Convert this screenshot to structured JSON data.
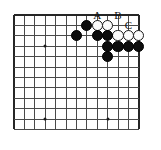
{
  "diagram": {
    "kind": "go-board-diagram",
    "board": {
      "columns": 13,
      "rows": 12,
      "cell_size": 10.4,
      "origin_x": 14,
      "origin_y": 15,
      "line_color": "#4a4a4a",
      "edge_color": "#262626",
      "background_color": "#ffffff"
    },
    "star_points": [
      {
        "col": 3,
        "row": 3
      },
      {
        "col": 3,
        "row": 10
      },
      {
        "col": 9,
        "row": 10
      }
    ],
    "stones": [
      {
        "color": "black",
        "col": 7,
        "row": 1
      },
      {
        "color": "white",
        "col": 8,
        "row": 1
      },
      {
        "color": "white",
        "col": 9,
        "row": 1
      },
      {
        "color": "black",
        "col": 6,
        "row": 2
      },
      {
        "color": "black",
        "col": 8,
        "row": 2
      },
      {
        "color": "black",
        "col": 9,
        "row": 2
      },
      {
        "color": "white",
        "col": 10,
        "row": 2
      },
      {
        "color": "white",
        "col": 11,
        "row": 2
      },
      {
        "color": "white",
        "col": 12,
        "row": 2
      },
      {
        "color": "black",
        "col": 9,
        "row": 3
      },
      {
        "color": "black",
        "col": 10,
        "row": 3
      },
      {
        "color": "black",
        "col": 11,
        "row": 3
      },
      {
        "color": "black",
        "col": 12,
        "row": 3
      },
      {
        "color": "black",
        "col": 9,
        "row": 4
      }
    ],
    "markers": [
      {
        "label": "A",
        "col": 8,
        "row": 0
      },
      {
        "label": "B",
        "col": 10,
        "row": 0
      },
      {
        "label": "C",
        "col": 11,
        "row": 1
      }
    ]
  }
}
